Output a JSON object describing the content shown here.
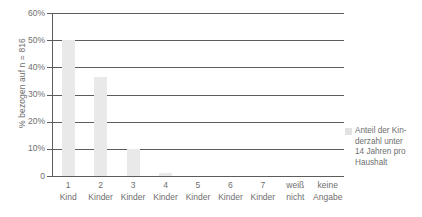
{
  "chart_data": {
    "type": "bar",
    "title": "",
    "subtitle": "",
    "xlabel": "",
    "ylabel": "% bezogen auf n = 816",
    "ylim": [
      0,
      60
    ],
    "ytick_values": [
      0,
      10,
      20,
      30,
      40,
      50,
      60
    ],
    "ytick_labels": [
      "0",
      "10%",
      "20%",
      "30%",
      "40%",
      "50%",
      "60%"
    ],
    "grid": true,
    "legend_position": "right",
    "categories": [
      "1 Kind",
      "2 Kinder",
      "3 Kinder",
      "4 Kinder",
      "5 Kinder",
      "6 Kinder",
      "7 Kinder",
      "weiß nicht",
      "keine Angabe"
    ],
    "category_lines": [
      [
        "1",
        "Kind"
      ],
      [
        "2",
        "Kinder"
      ],
      [
        "3",
        "Kinder"
      ],
      [
        "4",
        "Kinder"
      ],
      [
        "5",
        "Kinder"
      ],
      [
        "6",
        "Kinder"
      ],
      [
        "7",
        "Kinder"
      ],
      [
        "weiß",
        "nicht"
      ],
      [
        "keine",
        "Angabe"
      ]
    ],
    "series": [
      {
        "name": "Anteil der Kinderzahl unter 14 Jahren pro Haushalt",
        "color": "#e9e9e9",
        "values": [
          50,
          36.5,
          10,
          1,
          0,
          0,
          0,
          0,
          0
        ]
      }
    ]
  },
  "legend": {
    "swatch_color": "#e2e2e2",
    "lines": [
      "Anteil der Kin-",
      "derzahl  unter",
      "14 Jahren pro",
      "Haushalt"
    ]
  },
  "colors": {
    "bar": "#e9e9e9",
    "axis": "#5c5c5c",
    "text": "#6e6e6e",
    "background": "#ffffff"
  }
}
